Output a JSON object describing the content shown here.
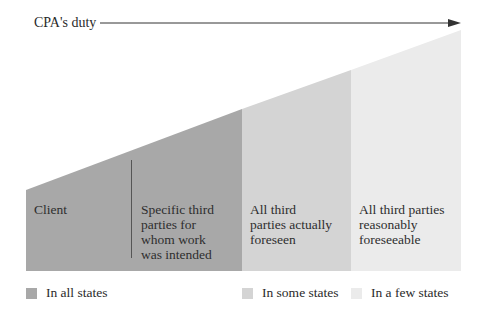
{
  "title": "CPA's duty",
  "colors": {
    "all": "#a8a8a8",
    "some": "#d4d4d4",
    "few": "#ebebeb",
    "arrow": "#333333"
  },
  "columns": [
    {
      "label": "Client",
      "category": "all"
    },
    {
      "label": "Specific third parties for whom work was intended",
      "lines": [
        "Specific third",
        "parties for",
        "whom work",
        "was intended"
      ],
      "category": "all"
    },
    {
      "label": "All third parties actually foreseen",
      "lines": [
        "All third",
        "parties actually",
        "foreseen"
      ],
      "category": "some"
    },
    {
      "label": "All third parties reasonably foreseeable",
      "lines": [
        "All third parties",
        "reasonably",
        "foreseeable"
      ],
      "category": "few"
    }
  ],
  "legend": [
    {
      "label": "In all states",
      "category": "all"
    },
    {
      "label": "In some states",
      "category": "some"
    },
    {
      "label": "In a few states",
      "category": "few"
    }
  ]
}
